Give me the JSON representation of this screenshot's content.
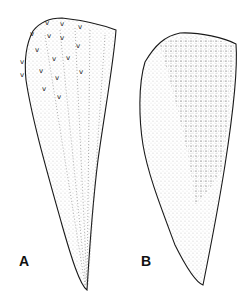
{
  "figure": {
    "panels": [
      {
        "label": "A",
        "subject": "scale with tubercles and radiating dotted lines"
      },
      {
        "label": "B",
        "subject": "scale with dotted grid pattern"
      }
    ],
    "colors": {
      "ink": "#1a1a1a",
      "background": "#ffffff"
    }
  }
}
